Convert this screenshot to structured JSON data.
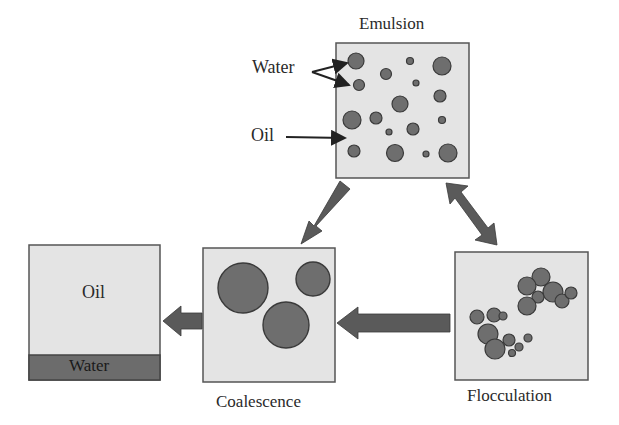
{
  "diagram": {
    "colors": {
      "box_fill": "#e4e4e4",
      "box_border": "#555555",
      "droplet_fill": "#6e6e6e",
      "droplet_border": "#3a3a3a",
      "arrow_fill": "#5a5a5a",
      "water_layer": "#6c6c6c",
      "text": "#2a2a2a"
    },
    "nodes": {
      "emulsion": {
        "label": "Emulsion",
        "annotations": {
          "water": "Water",
          "oil": "Oil"
        }
      },
      "flocculation": {
        "label": "Flocculation"
      },
      "coalescence": {
        "label": "Coalescence"
      },
      "phase_separation": {
        "oil_label": "Oil",
        "water_label": "Water"
      }
    },
    "edges": [
      {
        "from": "emulsion",
        "to": "coalescence",
        "type": "single"
      },
      {
        "from": "emulsion",
        "to": "flocculation",
        "type": "double"
      },
      {
        "from": "flocculation",
        "to": "coalescence",
        "type": "single"
      },
      {
        "from": "coalescence",
        "to": "phase_separation",
        "type": "single"
      }
    ]
  }
}
